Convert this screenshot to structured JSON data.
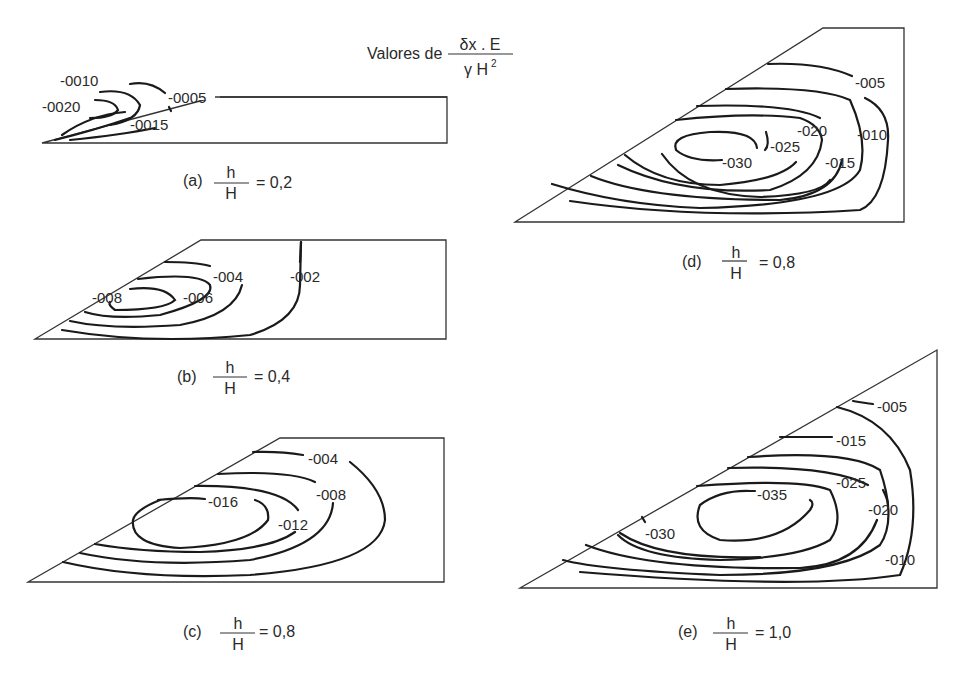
{
  "header": {
    "prefix": "Valores de",
    "numerator": "δx . E",
    "denominator_gamma": "γ H",
    "denominator_exp": "2"
  },
  "panels": [
    {
      "id": "a",
      "caption_letter": "(a)",
      "frac_num": "h",
      "frac_den": "H",
      "caption_value": "= 0,2",
      "contour_labels": [
        "-0010",
        "-0005",
        "-0020",
        "-0015"
      ]
    },
    {
      "id": "b",
      "caption_letter": "(b)",
      "frac_num": "h",
      "frac_den": "H",
      "caption_value": "= 0,4",
      "contour_labels": [
        "-004",
        "-002",
        "-008",
        "-006"
      ]
    },
    {
      "id": "c",
      "caption_letter": "(c)",
      "frac_num": "h",
      "frac_den": "H",
      "caption_value": "= 0,8",
      "contour_labels": [
        "-004",
        "-008",
        "-016",
        "-012"
      ]
    },
    {
      "id": "d",
      "caption_letter": "(d)",
      "frac_num": "h",
      "frac_den": "H",
      "caption_value": "= 0,8",
      "contour_labels": [
        "-005",
        "-020",
        "-010",
        "-025",
        "-030",
        "-015"
      ]
    },
    {
      "id": "e",
      "caption_letter": "(e)",
      "frac_num": "h",
      "frac_den": "H",
      "caption_value": "= 1,0",
      "contour_labels": [
        "-005",
        "-015",
        "-025",
        "-035",
        "-020",
        "-030",
        "-010"
      ]
    }
  ]
}
